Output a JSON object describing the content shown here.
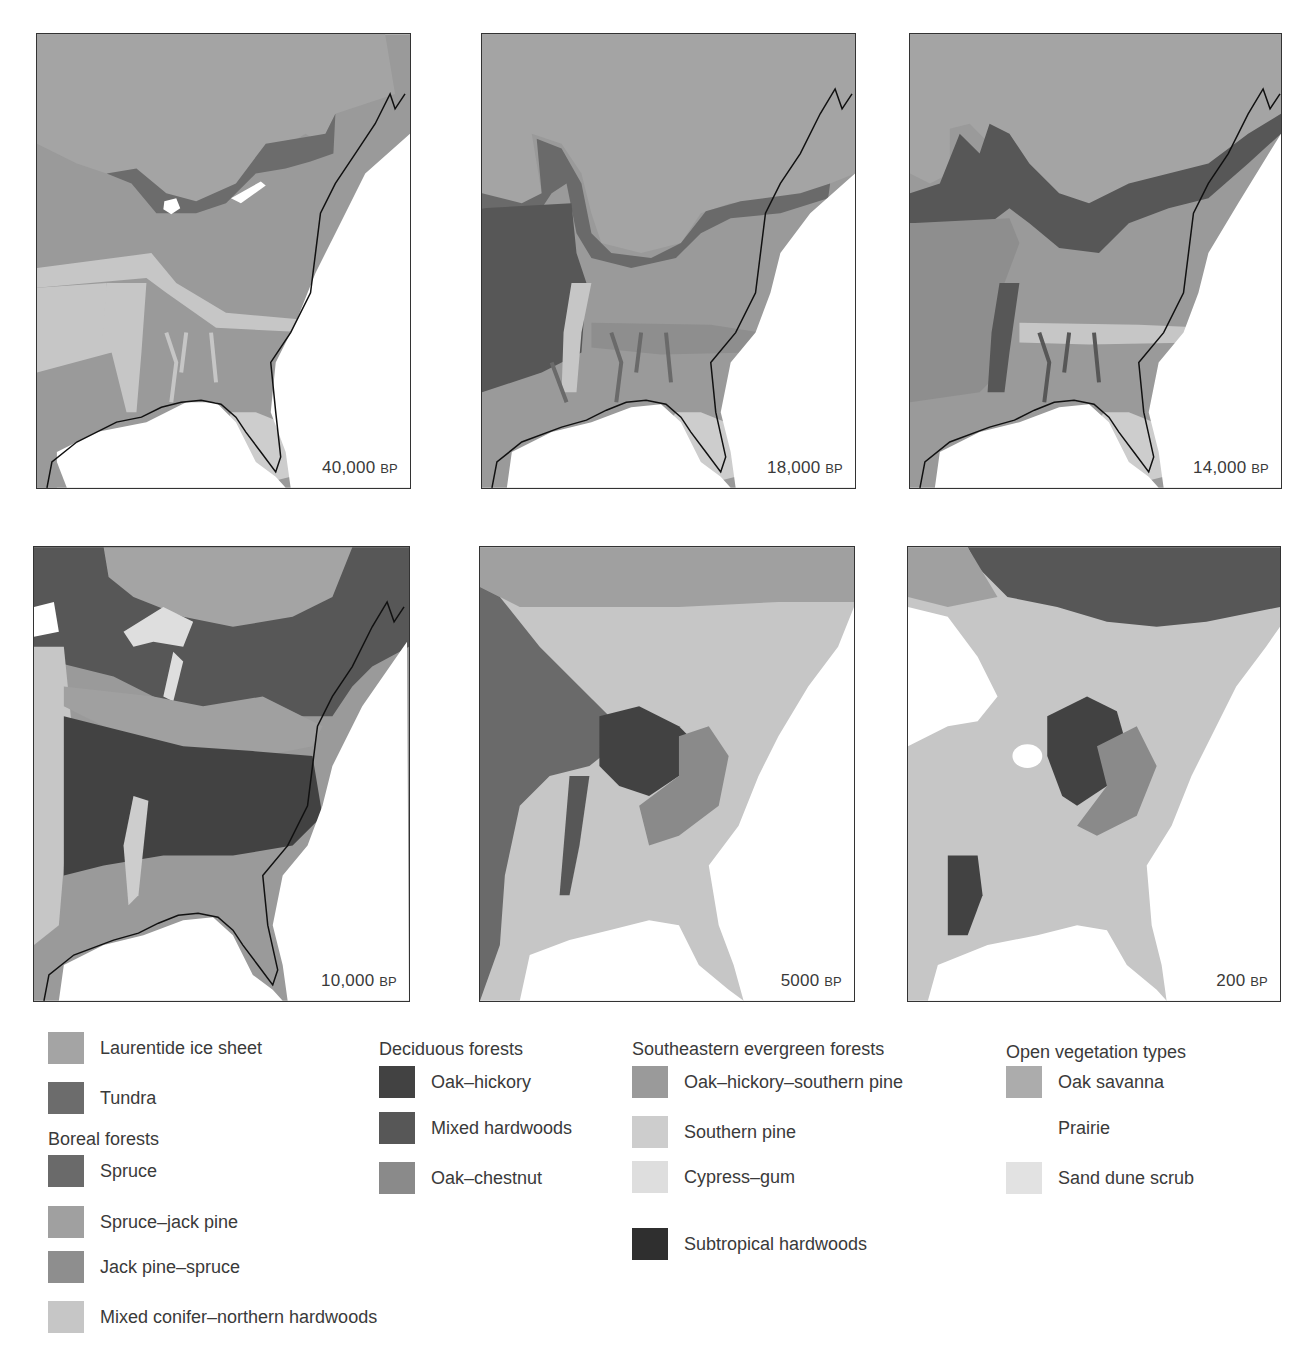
{
  "colors": {
    "ice": "#a4a4a4",
    "tundra": "#6c6c6c",
    "spruce": "#6a6a6a",
    "spruce_jack_pine": "#a0a0a0",
    "jack_pine_spruce": "#8e8e8e",
    "mixed_conifer": "#c6c6c6",
    "oak_hickory": "#424242",
    "mixed_hardwoods": "#575757",
    "oak_chestnut": "#8a8a8a",
    "oak_hickory_southern_pine": "#9a9a9a",
    "southern_pine": "#cdcdcd",
    "cypress_gum": "#dedede",
    "subtropical": "#2f2f2f",
    "oak_savanna": "#acacac",
    "prairie": "#ffffff",
    "sand_dune": "#e2e2e2",
    "coast": "#111111",
    "border": "#333333"
  },
  "panels": [
    {
      "value": "40,000",
      "unit": "BP"
    },
    {
      "value": "18,000",
      "unit": "BP"
    },
    {
      "value": "14,000",
      "unit": "BP"
    },
    {
      "value": "10,000",
      "unit": "BP"
    },
    {
      "value": "5000",
      "unit": "BP"
    },
    {
      "value": "200",
      "unit": "BP"
    }
  ],
  "legend": {
    "col1": {
      "ice": "Laurentide ice sheet",
      "tundra": "Tundra",
      "boreal_heading": "Boreal forests",
      "spruce": "Spruce",
      "spruce_jack_pine": "Spruce–jack pine",
      "jack_pine_spruce": "Jack pine–spruce",
      "mixed_conifer": "Mixed conifer–northern hardwoods"
    },
    "col2": {
      "heading": "Deciduous forests",
      "oak_hickory": "Oak–hickory",
      "mixed_hardwoods": "Mixed hardwoods",
      "oak_chestnut": "Oak–chestnut"
    },
    "col3": {
      "heading": "Southeastern evergreen forests",
      "oak_hickory_southern_pine": "Oak–hickory–southern pine",
      "southern_pine": "Southern pine",
      "cypress_gum": "Cypress–gum",
      "subtropical": "Subtropical hardwoods"
    },
    "col4": {
      "heading": "Open vegetation types",
      "oak_savanna": "Oak savanna",
      "prairie": "Prairie",
      "sand_dune": "Sand dune scrub"
    }
  }
}
